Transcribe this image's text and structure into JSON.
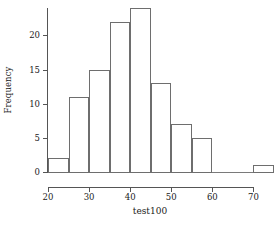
{
  "chart_data": {
    "type": "bar",
    "title": "",
    "subtitle": "",
    "xlabel": "test100",
    "ylabel": "Frequency",
    "bin_width": 5,
    "xlim": [
      20,
      75
    ],
    "ylim": [
      0,
      24
    ],
    "grid": false,
    "legend": null,
    "xticks": [
      20,
      30,
      40,
      50,
      60,
      70
    ],
    "xtick_labels": [
      "20",
      "30",
      "40",
      "50",
      "60",
      "70"
    ],
    "yticks": [
      0,
      5,
      10,
      15,
      20
    ],
    "ytick_labels": [
      "0",
      "5",
      "10",
      "15",
      "20"
    ],
    "bins": [
      {
        "start": 20,
        "end": 25,
        "label": "20-25",
        "value": 2
      },
      {
        "start": 25,
        "end": 30,
        "label": "25-30",
        "value": 11
      },
      {
        "start": 30,
        "end": 35,
        "label": "30-35",
        "value": 15
      },
      {
        "start": 35,
        "end": 40,
        "label": "35-40",
        "value": 22
      },
      {
        "start": 40,
        "end": 45,
        "label": "40-45",
        "value": 24
      },
      {
        "start": 45,
        "end": 50,
        "label": "45-50",
        "value": 13
      },
      {
        "start": 50,
        "end": 55,
        "label": "50-55",
        "value": 7
      },
      {
        "start": 55,
        "end": 60,
        "label": "55-60",
        "value": 5
      },
      {
        "start": 60,
        "end": 65,
        "label": "60-65",
        "value": 0
      },
      {
        "start": 65,
        "end": 70,
        "label": "65-70",
        "value": 0
      },
      {
        "start": 70,
        "end": 75,
        "label": "70-75",
        "value": 1
      }
    ],
    "categories": [
      "20-25",
      "25-30",
      "30-35",
      "35-40",
      "40-45",
      "45-50",
      "50-55",
      "55-60",
      "60-65",
      "65-70",
      "70-75"
    ],
    "values": [
      2,
      11,
      15,
      22,
      24,
      13,
      7,
      5,
      0,
      0,
      1
    ],
    "colors": {
      "bar_fill": "transparent",
      "bar_stroke": "#6e6e6e",
      "axis": "#555555",
      "text": "#1a1a1a",
      "background": "#ffffff"
    }
  }
}
